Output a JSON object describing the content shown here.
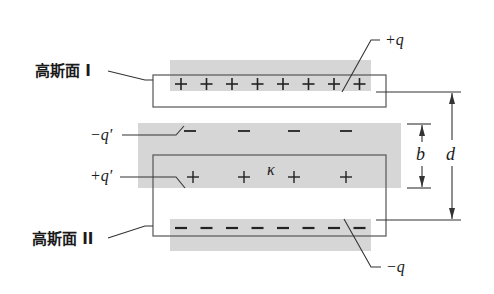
{
  "diagram": {
    "colors": {
      "background": "#ffffff",
      "shade": "#d6d6d6",
      "line": "#333333",
      "text": "#1a1a1a"
    },
    "labels": {
      "gauss_surface_1": "高斯面 I",
      "gauss_surface_2": "高斯面 II",
      "plus_q": "+q",
      "minus_q": "−q",
      "minus_q_prime": "−q′",
      "plus_q_prime": "+q′",
      "kappa": "κ",
      "b": "b",
      "d": "d"
    },
    "top_plate": {
      "charge_sign": "+",
      "count": 8
    },
    "bottom_plate": {
      "charge_sign": "−",
      "count": 8
    },
    "dielectric_top_surface": {
      "charge_sign": "−",
      "count": 4
    },
    "dielectric_bottom_surface": {
      "charge_sign": "+",
      "count": 4
    }
  }
}
